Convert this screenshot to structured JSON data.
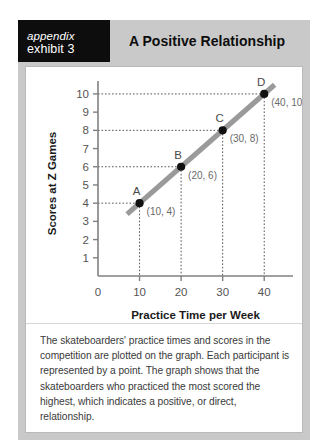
{
  "exhibit": {
    "tag_appendix": "appendix",
    "tag_exhibit": "exhibit 3",
    "title": "A Positive Relationship",
    "caption": "The skateboarders' practice times and scores in the competition are plotted on the graph. Each participant is represented by a point. The graph shows that the skateboarders who practiced the most scored the highest, which indicates a positive, or direct, relationship."
  },
  "colors": {
    "header_band": "#c9c9c9",
    "tag_block": "#0d0d0d",
    "panel": "#ffffff",
    "trend_line": "#9a9a9a",
    "point": "#111111",
    "axis": "#808080",
    "leader_line": "#555555"
  },
  "chart_data": {
    "type": "scatter",
    "title": "A Positive Relationship",
    "xlabel": "Practice Time per Week",
    "ylabel": "Scores at Z Games",
    "xlim": [
      0,
      45
    ],
    "ylim": [
      0,
      10.6
    ],
    "xticks": [
      0,
      10,
      20,
      30,
      40
    ],
    "yticks": [
      1,
      2,
      3,
      4,
      5,
      6,
      7,
      8,
      9,
      10
    ],
    "origin_label": "0",
    "grid": false,
    "legend": null,
    "points": [
      {
        "label": "A",
        "x": 10,
        "y": 4,
        "coord_label": "(10, 4)"
      },
      {
        "label": "B",
        "x": 20,
        "y": 6,
        "coord_label": "(20, 6)"
      },
      {
        "label": "C",
        "x": 30,
        "y": 8,
        "coord_label": "(30, 8)"
      },
      {
        "label": "D",
        "x": 40,
        "y": 10,
        "coord_label": "(40, 10)"
      }
    ],
    "trend_line": {
      "x0": 7,
      "y0": 3.4,
      "x1": 42.5,
      "y1": 10.5
    },
    "annotations": "Dotted leader lines connect each point to both axes."
  }
}
